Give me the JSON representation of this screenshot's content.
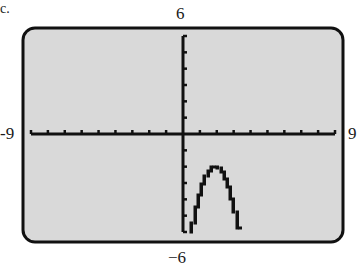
{
  "part_label": "c.",
  "window": {
    "xmin": -9,
    "xmax": 9,
    "ymin": -6,
    "ymax": 6,
    "xscl": 1,
    "yscl": 1,
    "xmin_label": "-9",
    "xmax_label": "9",
    "ymin_label": "−6",
    "ymax_label": "6"
  },
  "colors": {
    "screen": "#d9d9d9",
    "frame": "#111111",
    "axis": "#111111",
    "curve": "#111111"
  },
  "chart_data": {
    "type": "line",
    "title": "",
    "xlabel": "",
    "ylabel": "",
    "xlim": [
      -9,
      9
    ],
    "ylim": [
      -6,
      6
    ],
    "grid": false,
    "legend": null,
    "tick_labels": {
      "x": [
        "-9",
        "9"
      ],
      "y": [
        "−6",
        "6"
      ]
    },
    "series": [
      {
        "name": "parabola",
        "equation_estimate": "y = -2(x-2)^2 - 2",
        "vertex": [
          2,
          -2
        ],
        "x": [
          0.5,
          1.0,
          1.5,
          2.0,
          2.5,
          3.0,
          3.5
        ],
        "y": [
          -6.5,
          -4.0,
          -2.5,
          -2.0,
          -2.5,
          -4.0,
          -6.5
        ]
      }
    ]
  }
}
